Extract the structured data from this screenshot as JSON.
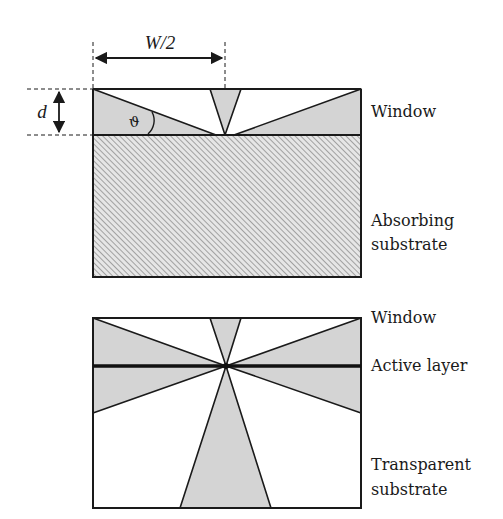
{
  "diagram": {
    "colors": {
      "outline": "#1a1a1a",
      "cone_fill": "#d4d4d4",
      "hatch": "#9a9a9a",
      "hatch_bg": "#e6e6e6",
      "background": "#ffffff"
    },
    "top_structure": {
      "dimension_width_label": "W/2",
      "dimension_thickness_label": "d",
      "angle_label": "ϑ",
      "layers": [
        {
          "name": "window",
          "label": "Window",
          "fill": "escape-cones"
        },
        {
          "name": "absorbing-substrate",
          "label_line1": "Absorbing",
          "label_line2": "substrate",
          "fill": "hatched"
        }
      ]
    },
    "bottom_structure": {
      "layers": [
        {
          "name": "window",
          "label": "Window"
        },
        {
          "name": "active-layer",
          "label": "Active layer"
        },
        {
          "name": "transparent-substrate",
          "label_line1": "Transparent",
          "label_line2": "substrate"
        }
      ]
    }
  }
}
